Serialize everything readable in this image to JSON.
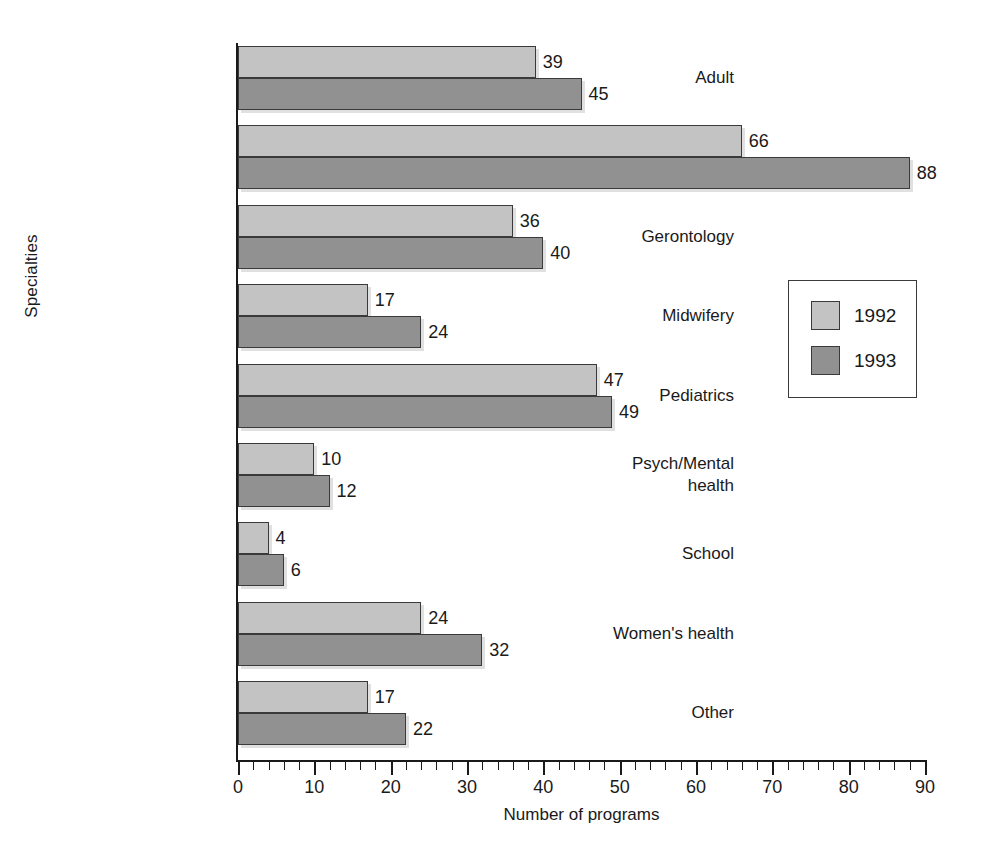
{
  "chart_data": {
    "type": "bar",
    "orientation": "horizontal",
    "title": "",
    "xlabel": "Number of programs",
    "ylabel": "Specialties",
    "xlim": [
      0,
      90
    ],
    "xticks": [
      0,
      10,
      20,
      30,
      40,
      50,
      60,
      70,
      80,
      90
    ],
    "xtick_labels": [
      "0",
      "10",
      "20",
      "30",
      "40",
      "50",
      "60",
      "70",
      "80",
      "90"
    ],
    "minor_tick_step": 2,
    "grid": false,
    "legend_position": "right-middle",
    "categories": [
      "Adult",
      "Family",
      "Gerontology",
      "Midwifery",
      "Pediatrics",
      "Psych/Mental\nhealth",
      "School",
      "Women's health",
      "Other"
    ],
    "series": [
      {
        "name": "1992",
        "color": "#c3c3c3",
        "values": [
          39,
          66,
          36,
          17,
          47,
          10,
          4,
          24,
          17
        ]
      },
      {
        "name": "1993",
        "color": "#919191",
        "values": [
          45,
          88,
          40,
          24,
          49,
          12,
          6,
          32,
          22
        ]
      }
    ]
  },
  "legend": {
    "entries": [
      {
        "label": "1992",
        "color": "#c3c3c3"
      },
      {
        "label": "1993",
        "color": "#919191"
      }
    ]
  },
  "axes": {
    "x_title": "Number of programs",
    "y_title": "Specialties"
  }
}
